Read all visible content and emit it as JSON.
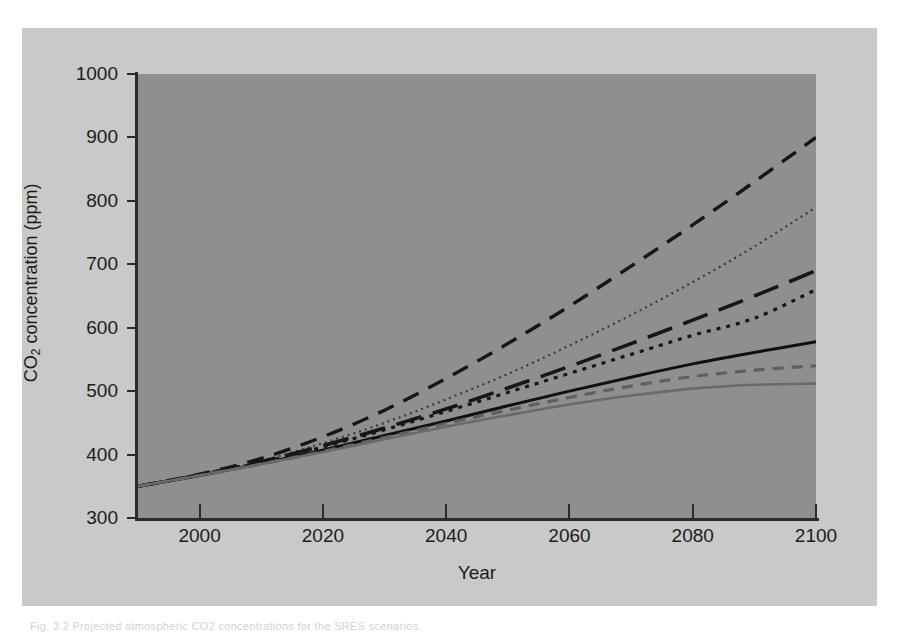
{
  "figure": {
    "background_color": "#c9c9c9",
    "plot_background_color": "#8f8f8f",
    "axis_color": "#2b2b2b",
    "caption_sliver": "Fig. 3.2  Projected atmospheric CO2 concentrations for the SRES scenarios."
  },
  "chart_data": {
    "type": "line",
    "title": "",
    "xlabel": "Year",
    "ylabel_text": "CO",
    "ylabel_sub": "2",
    "ylabel_tail": " concentration (ppm)",
    "ylabel_plain": "CO2 concentration (ppm)",
    "xlim": [
      1990,
      2100
    ],
    "ylim": [
      300,
      1000
    ],
    "grid": false,
    "legend_position": "none",
    "xticks": [
      2000,
      2020,
      2040,
      2060,
      2080,
      2100
    ],
    "xtick_labels": [
      "2000",
      "2020",
      "2040",
      "2060",
      "2080",
      "2100"
    ],
    "yticks": [
      300,
      400,
      500,
      600,
      700,
      800,
      900,
      1000
    ],
    "ytick_labels": [
      "300",
      "400",
      "500",
      "600",
      "700",
      "800",
      "900",
      "1000"
    ],
    "x": [
      1990,
      2000,
      2010,
      2020,
      2030,
      2040,
      2050,
      2060,
      2070,
      2080,
      2090,
      2100
    ],
    "series": [
      {
        "name": "A1FI",
        "style": "dashed",
        "color": "#161616",
        "width": 3.4,
        "dash": "17,11",
        "values": [
          350,
          369,
          394,
          428,
          470,
          520,
          575,
          634,
          697,
          762,
          830,
          900
        ]
      },
      {
        "name": "A2",
        "style": "dotted-fine",
        "color": "#3a3a3a",
        "width": 2.2,
        "dash": "2,4",
        "values": [
          350,
          368,
          390,
          418,
          450,
          487,
          527,
          572,
          620,
          672,
          728,
          790
        ]
      },
      {
        "name": "A1B",
        "style": "long-dash",
        "color": "#161616",
        "width": 3.6,
        "dash": "26,12",
        "values": [
          350,
          368,
          389,
          414,
          442,
          472,
          505,
          539,
          575,
          612,
          650,
          690
        ]
      },
      {
        "name": "B2",
        "style": "dotted-coarse",
        "color": "#161616",
        "width": 3.2,
        "dash": "4,6",
        "values": [
          350,
          368,
          388,
          412,
          439,
          468,
          498,
          528,
          558,
          588,
          615,
          660
        ]
      },
      {
        "name": "A1T",
        "style": "solid",
        "color": "#101010",
        "width": 3.0,
        "dash": "none",
        "values": [
          350,
          367,
          386,
          407,
          430,
          453,
          477,
          500,
          522,
          543,
          561,
          578
        ]
      },
      {
        "name": "B1",
        "style": "dashed-gray",
        "color": "#5f5f5f",
        "width": 3.2,
        "dash": "11,8",
        "values": [
          350,
          367,
          385,
          405,
          427,
          449,
          470,
          490,
          508,
          523,
          533,
          540
        ]
      },
      {
        "name": "IS92a-low",
        "style": "solid-gray",
        "color": "#6a6a6a",
        "width": 2.6,
        "dash": "none",
        "values": [
          350,
          367,
          385,
          404,
          424,
          444,
          462,
          479,
          493,
          504,
          510,
          512
        ]
      }
    ]
  }
}
